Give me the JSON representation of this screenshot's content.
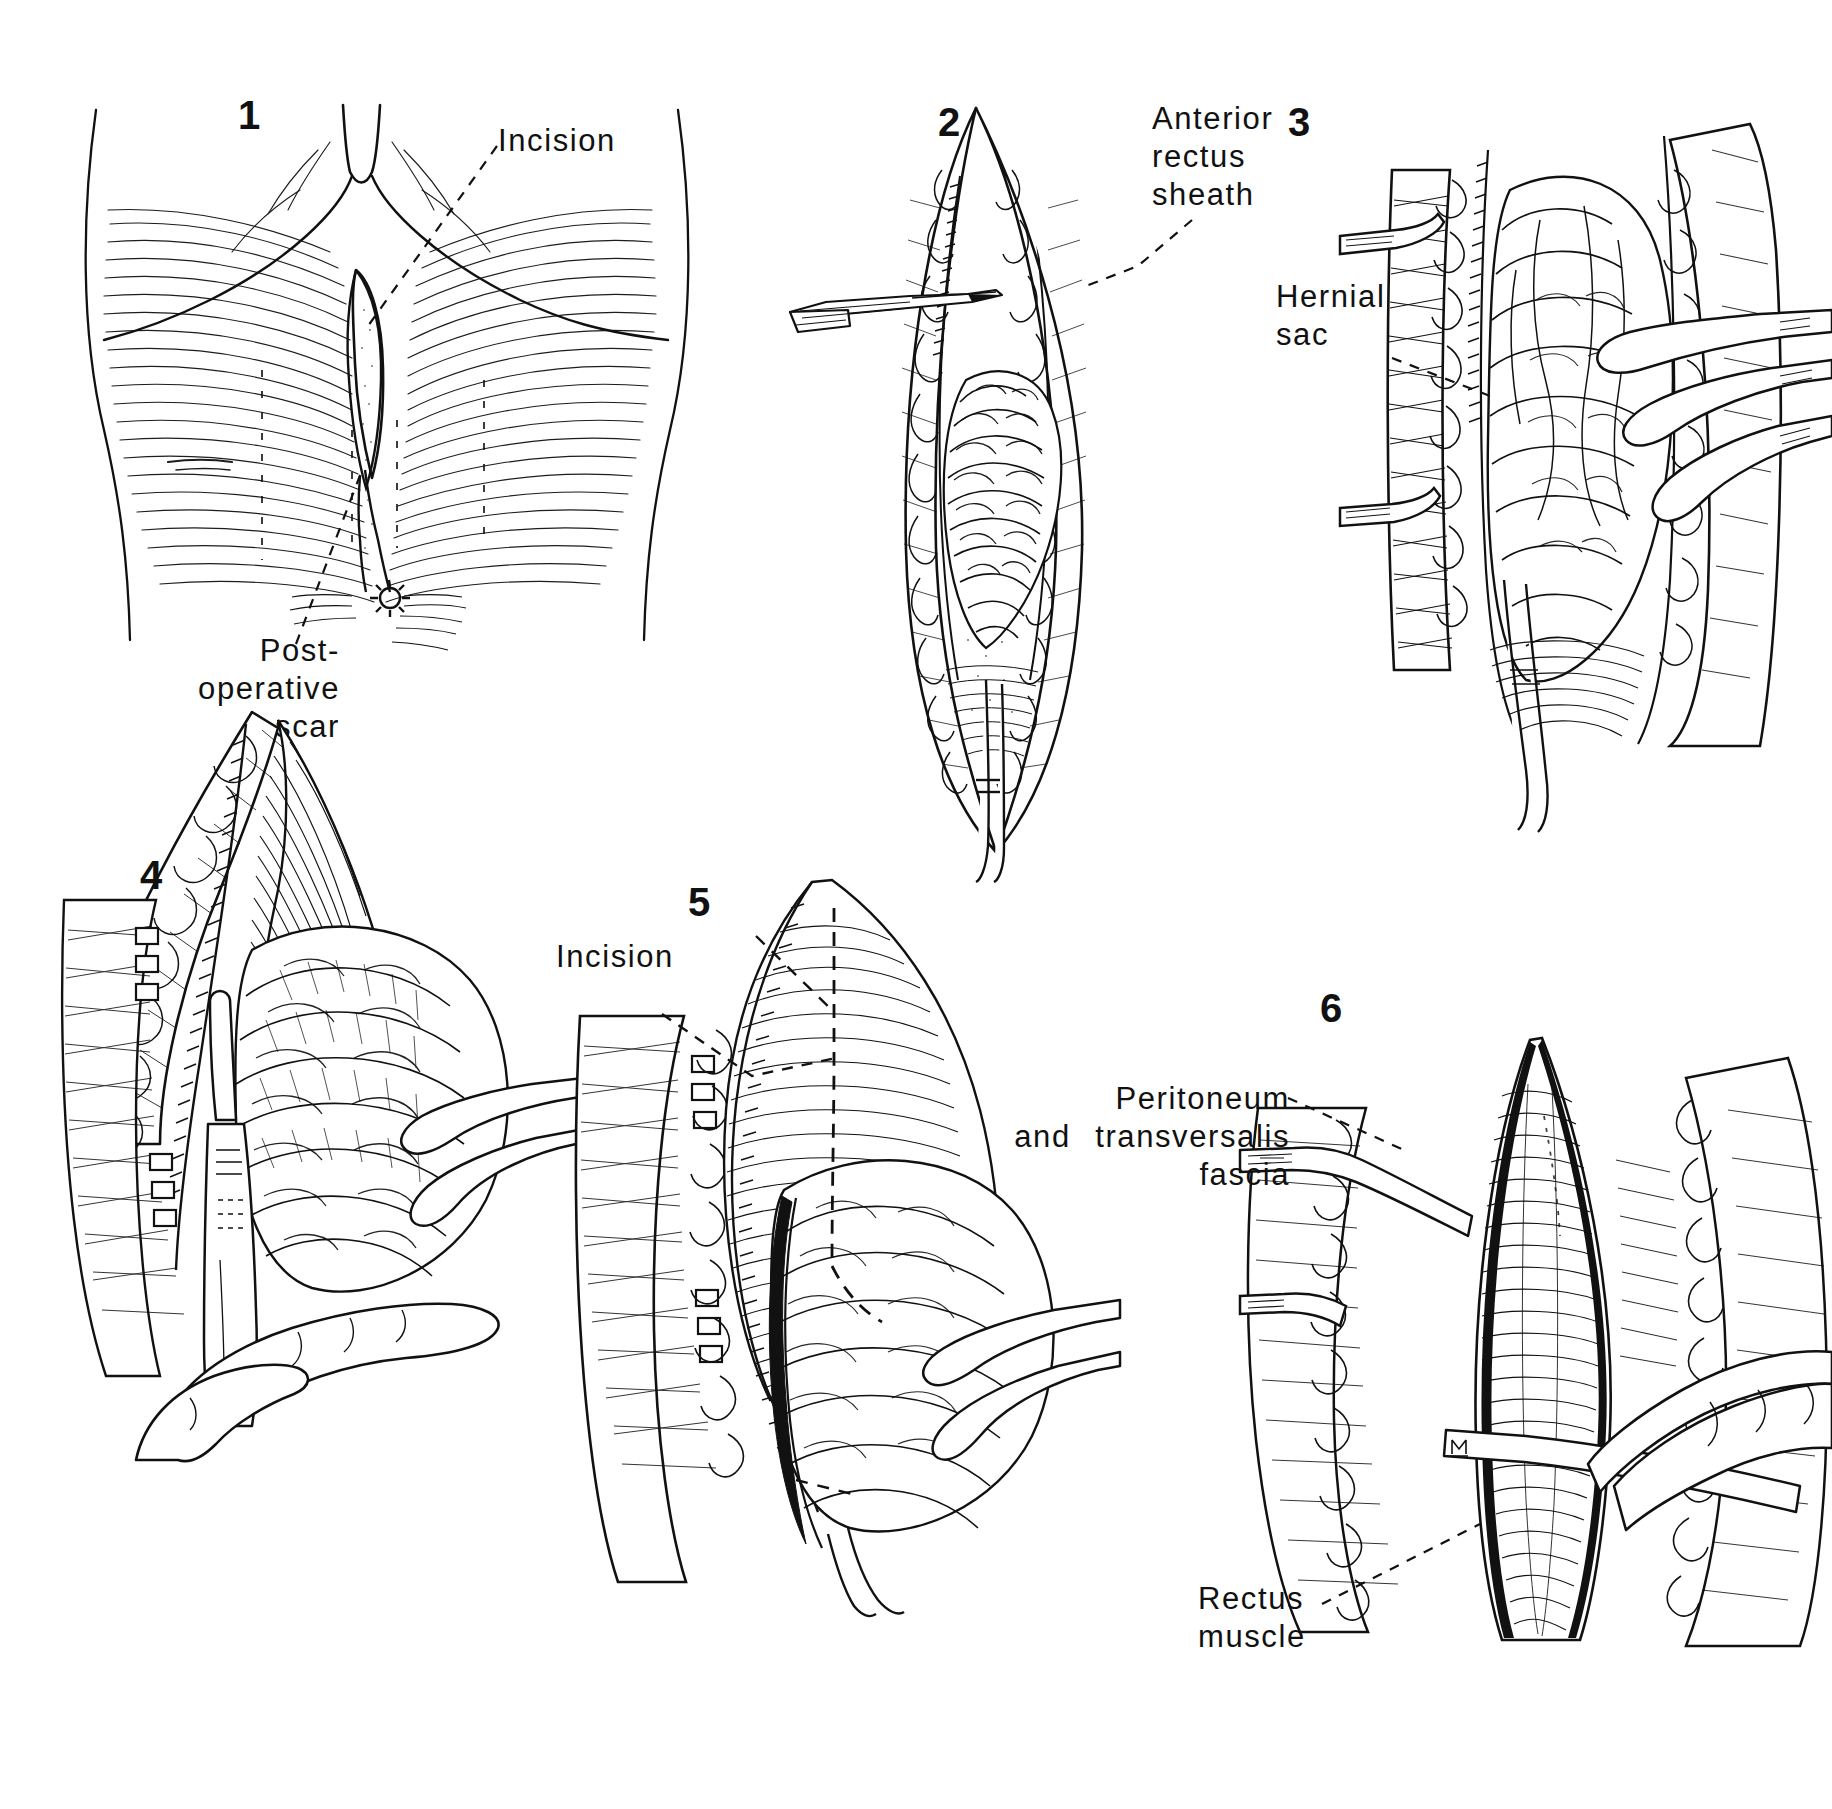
{
  "figure": {
    "kind": "surgical-illustration-plate",
    "background_color": "#ffffff",
    "ink_color": "#111111",
    "panel_count": 6
  },
  "panels": [
    {
      "number": "1",
      "number_pos": {
        "x": 238,
        "y": 95
      },
      "caption": "Upper abdominal wall with midline epigastric bulge",
      "labels": [
        {
          "name": "incision-label",
          "text": "Incision",
          "x": 498,
          "y": 122,
          "align": "left"
        },
        {
          "name": "post-operative-scar-label",
          "text": "Post-\noperative\nscar",
          "x": 200,
          "y": 632,
          "align": "right"
        }
      ]
    },
    {
      "number": "2",
      "number_pos": {
        "x": 938,
        "y": 102
      },
      "caption": "Anterior rectus sheath incised with scalpel exposing hernial protrusion",
      "labels": [
        {
          "name": "anterior-rectus-sheath-label",
          "text": "Anterior\nrectus\nsheath",
          "x": 1155,
          "y": 100,
          "align": "left"
        }
      ]
    },
    {
      "number": "3",
      "number_pos": {
        "x": 1288,
        "y": 102
      },
      "caption": "Hernial sac delivered and held with clamps",
      "labels": [
        {
          "name": "hernial-sac-label",
          "text": "Hernial\nsac",
          "x": 1276,
          "y": 278,
          "align": "left"
        }
      ]
    },
    {
      "number": "4",
      "number_pos": {
        "x": 140,
        "y": 855
      },
      "caption": "Sac dissected free from the sheath with scalpel",
      "labels": []
    },
    {
      "number": "5",
      "number_pos": {
        "x": 700,
        "y": 900
      },
      "caption": "Dashed line marks the planned incision around the neck of the sac",
      "labels": [
        {
          "name": "incision-label",
          "text": "Incision",
          "x": 556,
          "y": 938,
          "align": "left"
        }
      ]
    },
    {
      "number": "6",
      "number_pos": {
        "x": 1320,
        "y": 988
      },
      "caption": "Defect opened showing peritoneum, transversalis fascia and rectus muscle",
      "labels": [
        {
          "name": "peritoneum-transversalis-fascia-label",
          "text": "Peritoneum\nand  transversalis\nfascia",
          "x": 1290,
          "y": 1080,
          "align": "right"
        },
        {
          "name": "rectus-muscle-label",
          "text": "Rectus\nmuscle",
          "x": 1198,
          "y": 1580,
          "align": "left"
        }
      ]
    }
  ],
  "signature": {
    "name": "artist-monogram",
    "x": 1452,
    "y": 1434,
    "text": ""
  }
}
